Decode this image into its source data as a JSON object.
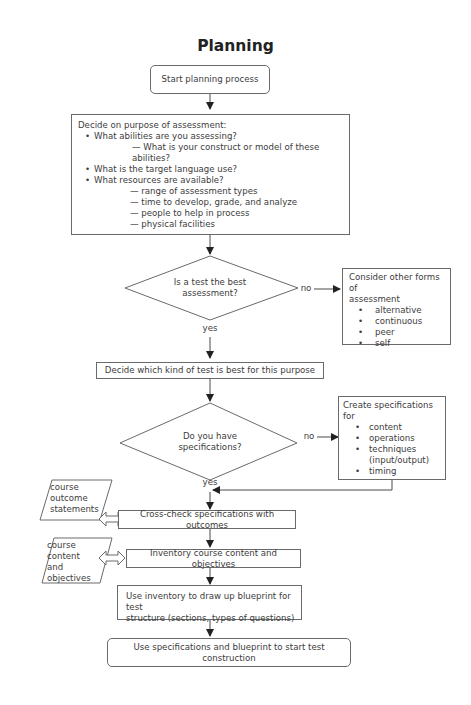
{
  "title": "Planning",
  "nodes": {
    "start": "Start planning process",
    "purpose": {
      "heading": "Decide on purpose of assessment:",
      "items": [
        {
          "text": "What abilities are you assessing?",
          "sub": [
            "— What is your construct or model of these abilities?"
          ]
        },
        {
          "text": "What is the target language use?",
          "sub": []
        },
        {
          "text": "What resources are available?",
          "sub": [
            "— range of assessment types",
            "— time to develop, grade, and analyze",
            "— people to help in process",
            "— physical facilities"
          ]
        }
      ]
    },
    "decision_test": {
      "line1": "Is a test the best",
      "line2": "assessment?"
    },
    "other_forms": {
      "heading_line1": "Consider other forms of",
      "heading_line2": "assessment",
      "items": [
        "alternative",
        "continuous",
        "peer",
        "self"
      ]
    },
    "which_test": "Decide which kind of test is best for this purpose",
    "decision_specs": {
      "line1": "Do you have",
      "line2": "specifications?"
    },
    "create_specs": {
      "heading": "Create specifications for",
      "items": [
        "content",
        "operations",
        "techniques",
        "(input/output)",
        "timing"
      ]
    },
    "cross_check": "Cross-check specifications with outcomes",
    "inventory": "Inventory course content and objectives",
    "blueprint": {
      "line1": "Use inventory to draw up blueprint for test",
      "line2": "structure (sections, types of questions)"
    },
    "construction": "Use specifications and blueprint to start test construction",
    "input_outcomes": {
      "lines": [
        "course",
        "outcome",
        "statements"
      ]
    },
    "input_content": {
      "lines": [
        "course",
        "content",
        "and",
        "objectives"
      ]
    }
  },
  "edge_labels": {
    "test_no": "no",
    "test_yes": "yes",
    "specs_no": "no",
    "specs_yes": "yes"
  },
  "colors": {
    "line": "#4a4a4a",
    "border": "#6a6a6a",
    "text": "#3c3c3c"
  }
}
